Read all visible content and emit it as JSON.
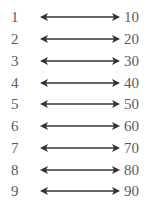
{
  "diagram": {
    "type": "mapping",
    "relation": "bidirectional",
    "rows": [
      {
        "left": "1",
        "right": "10"
      },
      {
        "left": "2",
        "right": "20"
      },
      {
        "left": "3",
        "right": "30"
      },
      {
        "left": "4",
        "right": "40"
      },
      {
        "left": "5",
        "right": "50"
      },
      {
        "left": "6",
        "right": "60"
      },
      {
        "left": "7",
        "right": "70"
      },
      {
        "left": "8",
        "right": "80"
      },
      {
        "left": "9",
        "right": "90"
      }
    ]
  }
}
